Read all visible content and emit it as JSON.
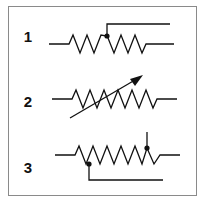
{
  "diagram": {
    "colors": {
      "stroke": "#111111",
      "border": "#8a8a8a",
      "background": "#ffffff"
    },
    "symbols": [
      {
        "label": "1",
        "type": "potentiometer-wiper-top"
      },
      {
        "label": "2",
        "type": "variable-resistor-arrow"
      },
      {
        "label": "3",
        "type": "resistor-two-taps"
      }
    ]
  }
}
